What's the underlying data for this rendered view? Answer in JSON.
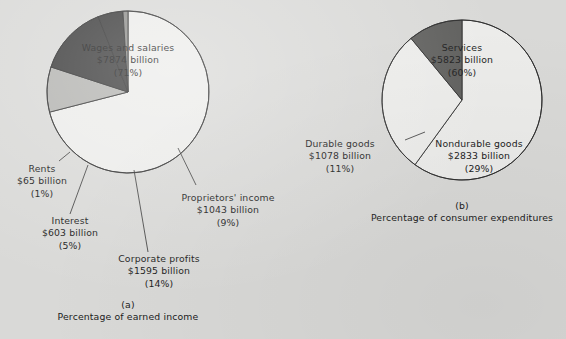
{
  "page": {
    "background_color": "#d9d9d7",
    "text_color": "#1b1b1b"
  },
  "chart_data": [
    {
      "type": "pie",
      "id": "a",
      "title": "",
      "caption_letter": "(a)",
      "caption": "Percentage of earned income",
      "unit": "billion dollars",
      "start_angle_deg": 0,
      "direction": "clockwise",
      "categories": [
        "Wages and salaries",
        "Proprietors' income",
        "Corporate profits",
        "Interest",
        "Rents"
      ],
      "values": [
        7874,
        1043,
        1595,
        603,
        65
      ],
      "percents": [
        71,
        9,
        14,
        5,
        1
      ],
      "colors": [
        "#ececea",
        "#b3b3b0",
        "#3a3a3a",
        "#3a3a3a",
        "#8d8d8a"
      ],
      "slices": [
        {
          "label": "Wages and salaries",
          "value_text": "$7874 billion",
          "percent_text": "(71%)",
          "percent": 71,
          "color": "#ececea",
          "leader": false
        },
        {
          "label": "Proprietors' income",
          "value_text": "$1043 billion",
          "percent_text": "(9%)",
          "percent": 9,
          "color": "#b3b3b0",
          "leader": true
        },
        {
          "label": "Corporate profits",
          "value_text": "$1595 billion",
          "percent_text": "(14%)",
          "percent": 14,
          "color": "#3a3a3a",
          "leader": true
        },
        {
          "label": "Interest",
          "value_text": "$603 billion",
          "percent_text": "(5%)",
          "percent": 5,
          "color": "#3a3a3a",
          "leader": true
        },
        {
          "label": "Rents",
          "value_text": "$65 billion",
          "percent_text": "(1%)",
          "percent": 1,
          "color": "#8d8d8a",
          "leader": true
        }
      ]
    },
    {
      "type": "pie",
      "id": "b",
      "title": "",
      "caption_letter": "(b)",
      "caption": "Percentage of consumer expenditures",
      "unit": "billion dollars",
      "start_angle_deg": 0,
      "direction": "clockwise",
      "categories": [
        "Services",
        "Nondurable goods",
        "Durable goods"
      ],
      "values": [
        5823,
        2833,
        1078
      ],
      "percents": [
        60,
        29,
        11
      ],
      "colors": [
        "#ececea",
        "#ececea",
        "#5e5e5c"
      ],
      "slices": [
        {
          "label": "Services",
          "value_text": "$5823 billion",
          "percent_text": "(60%)",
          "percent": 60,
          "color": "#ececea",
          "leader": false
        },
        {
          "label": "Nondurable goods",
          "value_text": "$2833 billion",
          "percent_text": "(29%)",
          "percent": 29,
          "color": "#ececea",
          "leader": false
        },
        {
          "label": "Durable goods",
          "value_text": "$1078 billion",
          "percent_text": "(11%)",
          "percent": 11,
          "color": "#5e5e5c",
          "leader": true
        }
      ]
    }
  ]
}
